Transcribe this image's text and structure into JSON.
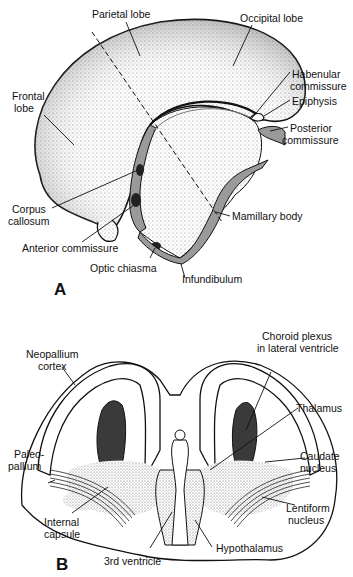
{
  "panel_a": {
    "letter": "A",
    "labels": {
      "parietal_lobe": "Parietal lobe",
      "occipital_lobe": "Occipital lobe",
      "frontal_lobe_1": "Frontal",
      "frontal_lobe_2": "lobe",
      "habenular_1": "Habenular",
      "habenular_2": "commissure",
      "epiphysis": "Epiphysis",
      "posterior_1": "Posterior",
      "posterior_2": "commissure",
      "corpus_1": "Corpus",
      "corpus_2": "callosum",
      "mamillary_body": "Mamillary body",
      "anterior_commissure": "Anterior commissure",
      "optic_chiasma": "Optic chiasma",
      "infundibulum": "Infundibulum"
    }
  },
  "panel_b": {
    "letter": "B",
    "labels": {
      "neopallium_1": "Neopallium",
      "neopallium_2": "cortex",
      "choroid_1": "Choroid plexus",
      "choroid_2": "in lateral ventricle",
      "thalamus": "Thalamus",
      "paleo_1": "Paleo-",
      "paleo_2": "pallium",
      "caudate_1": "Caudate",
      "caudate_2": "nucleus",
      "internal_1": "Internal",
      "internal_2": "capsule",
      "lentiform_1": "Lentiform",
      "lentiform_2": "nucleus",
      "third_ventricle": "3rd ventricle",
      "hypothalamus": "Hypothalamus"
    }
  },
  "colors": {
    "ink": "#111111",
    "gray_fill": "#9a9a9a",
    "stipple": "#cfcfcf"
  }
}
